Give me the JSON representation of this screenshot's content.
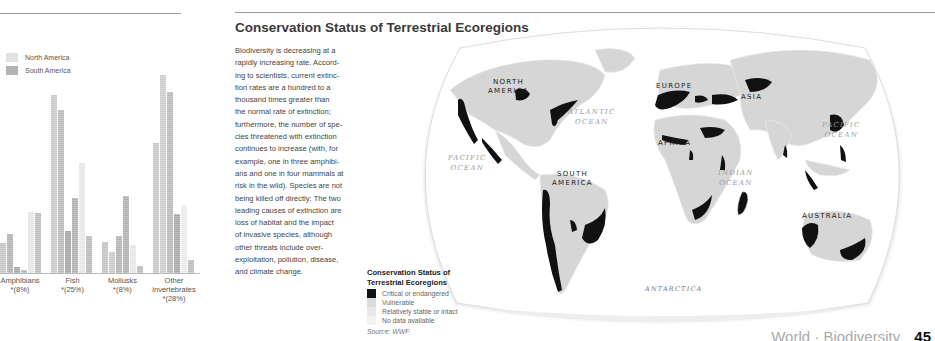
{
  "left_page": {
    "legend": [
      {
        "label": "North America",
        "color": "#e2e2e2"
      },
      {
        "label": "South America",
        "color": "#b3b3b3"
      }
    ]
  },
  "chart_data": {
    "type": "bar",
    "title": "",
    "xlabel": "",
    "ylabel": "",
    "grid": false,
    "legend_position": "top-left",
    "values_are_relative": true,
    "value_unit": "relative bar height (px); no y-axis shown",
    "categories": [
      {
        "label": "Amphibians",
        "sub": "*(8%)"
      },
      {
        "label": "Fish",
        "sub": "*(25%)"
      },
      {
        "label": "Mollusks",
        "sub": "*(8%)"
      },
      {
        "label": "Other invertebrates",
        "sub": "*(28%)"
      }
    ],
    "bars": [
      {
        "x": 0,
        "h": 30,
        "c": "#c6c6c6"
      },
      {
        "x": 7,
        "h": 39,
        "c": "#b3b3b3"
      },
      {
        "x": 14,
        "h": 6,
        "c": "#a8a8a8"
      },
      {
        "x": 21,
        "h": 3,
        "c": "#b8b8b8"
      },
      {
        "x": 28,
        "h": 61,
        "c": "#e6e6e6"
      },
      {
        "x": 35,
        "h": 60,
        "c": "#bdbdbd"
      },
      {
        "x": 51,
        "h": 178,
        "c": "#c9c9c9"
      },
      {
        "x": 58,
        "h": 163,
        "c": "#bbbbbb"
      },
      {
        "x": 65,
        "h": 42,
        "c": "#a6a6a6"
      },
      {
        "x": 72,
        "h": 75,
        "c": "#b0b0b0"
      },
      {
        "x": 79,
        "h": 110,
        "c": "#e8e8e8"
      },
      {
        "x": 86,
        "h": 37,
        "c": "#bcbcbc"
      },
      {
        "x": 102,
        "h": 31,
        "c": "#c3c3c3"
      },
      {
        "x": 109,
        "h": 21,
        "c": "#c9c9c9"
      },
      {
        "x": 116,
        "h": 37,
        "c": "#b4b4b4"
      },
      {
        "x": 123,
        "h": 77,
        "c": "#b1b1b1"
      },
      {
        "x": 130,
        "h": 28,
        "c": "#e7e7e7"
      },
      {
        "x": 137,
        "h": 7,
        "c": "#bdbdbd"
      },
      {
        "x": 153,
        "h": 130,
        "c": "#c7c7c7"
      },
      {
        "x": 160,
        "h": 198,
        "c": "#cdcdcd"
      },
      {
        "x": 167,
        "h": 181,
        "c": "#b9b9b9"
      },
      {
        "x": 174,
        "h": 59,
        "c": "#a9a9a9"
      },
      {
        "x": 181,
        "h": 68,
        "c": "#ececec"
      },
      {
        "x": 188,
        "h": 13,
        "c": "#bdbdbd"
      }
    ],
    "series": [
      {
        "name": "North America",
        "values": [
          30,
          178,
          31,
          130
        ]
      },
      {
        "name": "South America",
        "values": [
          39,
          163,
          21,
          198
        ]
      }
    ]
  },
  "right_page": {
    "title": "Conservation Status of Terrestrial Ecoregions",
    "body_lines": [
      "Biodiversity is decreasing at a",
      "rapidly increasing rate. Accord-",
      "ing to scientists, current extinc-",
      "tion rates are a hundred to a",
      "thousand times greater than",
      "the normal rate of extinction;",
      "furthermore, the number of spe-",
      "cies threatened with extinction",
      "continues to increase (with, for",
      "example, one in three amphibi-",
      "ans and one in four mammals at",
      "risk in the wild). Species are not",
      "being killed off directly: The two",
      "leading causes of extinction are",
      "loss of habitat and the impact",
      "of invasive species, although",
      "other threats include over-",
      "exploitation, pollution, disease,",
      "and climate change."
    ],
    "map_legend": {
      "title_line1": "Conservation Status of",
      "title_line2": "Terrestrial Ecoregions",
      "items": [
        {
          "label": "Critical or endangered",
          "color": "#111111"
        },
        {
          "label": "Vulnerable",
          "color": "#dcdcdc"
        },
        {
          "label": "Relatively stable or intact",
          "color": "#e8e8e8"
        },
        {
          "label": "No data available",
          "color": "#f2f2f2"
        }
      ],
      "source": "Source: WWF"
    },
    "map": {
      "oceans": [
        {
          "line1": "ATLANTIC",
          "line2": "OCEAN"
        },
        {
          "line1": "PACIFIC",
          "line2": "OCEAN"
        },
        {
          "line1": "PACIFIC",
          "line2": "OCEAN"
        },
        {
          "line1": "INDIAN",
          "line2": "OCEAN"
        }
      ],
      "continents": [
        {
          "line1": "NORTH",
          "line2": "AMERICA"
        },
        {
          "line1": "SOUTH",
          "line2": "AMERICA"
        },
        {
          "line1": "EUROPE",
          "line2": ""
        },
        {
          "line1": "AFRICA",
          "line2": ""
        },
        {
          "line1": "ASIA",
          "line2": ""
        },
        {
          "line1": "AUSTRALIA",
          "line2": ""
        }
      ],
      "antarctica": "ANTARCTICA"
    },
    "footer": {
      "section": "World",
      "topic": "Biodiversity",
      "page": "45"
    }
  }
}
